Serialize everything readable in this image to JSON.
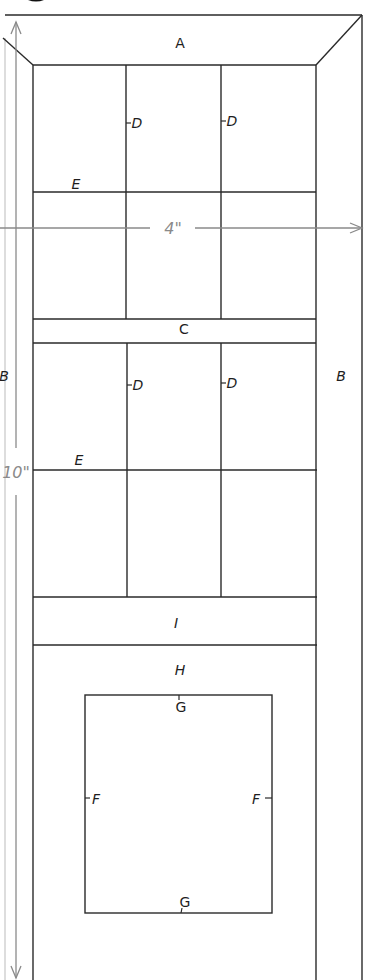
{
  "diagram": {
    "type": "block-pattern-template",
    "colors": {
      "line": "#2a2a2a",
      "dimension": "#8a8a8a",
      "background": "#ffffff"
    },
    "dimensions": {
      "width_label": "4\"",
      "height_label": "10\""
    },
    "labels": {
      "top_border": "A",
      "left_border": "B",
      "right_border": "B",
      "middle_sash": "C",
      "vertical_muntin_upper_left": "D",
      "vertical_muntin_upper_right": "D",
      "vertical_muntin_lower_left": "D",
      "vertical_muntin_lower_right": "D",
      "horizontal_muntin_upper": "E",
      "horizontal_muntin_lower": "E",
      "square_side_left": "F",
      "square_side_right": "F",
      "square_top": "G",
      "square_bottom": "G",
      "bottom_panel": "H",
      "lower_sash": "I"
    }
  }
}
